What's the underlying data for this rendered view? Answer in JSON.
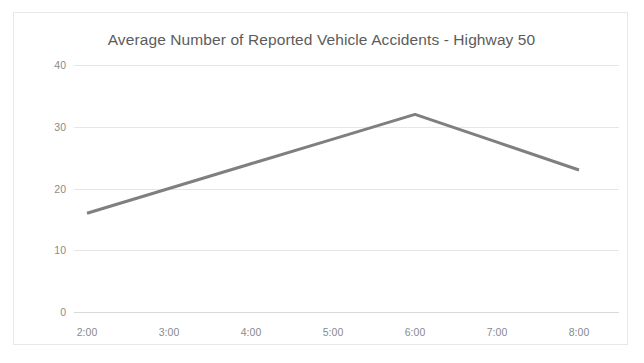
{
  "chart_data": {
    "type": "line",
    "title": "Average Number of Reported Vehicle Accidents - Highway 50",
    "xlabel": "",
    "ylabel": "",
    "categories": [
      "2:00",
      "3:00",
      "4:00",
      "5:00",
      "6:00",
      "7:00",
      "8:00"
    ],
    "series": [
      {
        "name": "Average Number of Reported Vehicle Accidents",
        "color": "#7f7f7f",
        "values": [
          16,
          20,
          24,
          28,
          32,
          27.5,
          23
        ]
      }
    ],
    "ylim": [
      0,
      40
    ],
    "yticks": [
      "0",
      "10",
      "20",
      "30",
      "40"
    ],
    "ytick_values": [
      0,
      10,
      20,
      30,
      40
    ],
    "grid": true,
    "legend": false,
    "legend_position": "none",
    "background": "#ffffff",
    "border_color": "#e8e8e8",
    "gridline_color": "#e6e6e6",
    "tick_label_color": "#8a8a8a",
    "title_color": "#5c5c5c"
  }
}
